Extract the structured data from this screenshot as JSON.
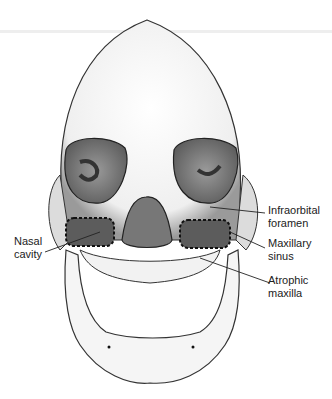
{
  "figure": {
    "labels": [
      {
        "id": "infraorbital",
        "line1": "Infraorbital",
        "line2": "foramen"
      },
      {
        "id": "maxillary",
        "line1": "Maxillary",
        "line2": "sinus"
      },
      {
        "id": "nasal",
        "line1": "Nasal",
        "line2": "cavity"
      },
      {
        "id": "atrophic",
        "line1": "Atrophic",
        "line2": "maxilla"
      }
    ],
    "colors": {
      "ink": "#222222",
      "shade": "#555555",
      "bone": "#f4f4f4"
    }
  }
}
